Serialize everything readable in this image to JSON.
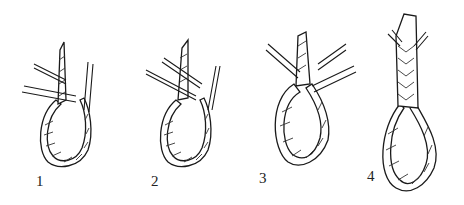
{
  "figure": {
    "steps": [
      {
        "label": "1"
      },
      {
        "label": "2"
      },
      {
        "label": "3"
      },
      {
        "label": "4"
      }
    ]
  }
}
